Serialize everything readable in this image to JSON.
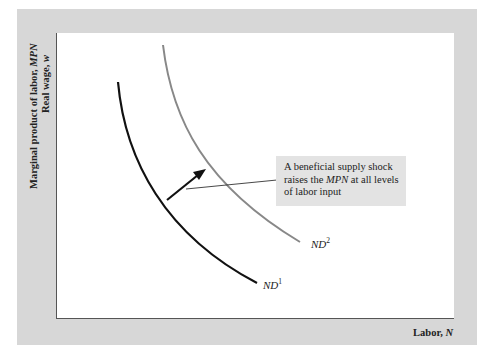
{
  "diagram": {
    "y_axis": {
      "label_line1_prefix": "Marginal product of labor, ",
      "label_line1_var": "MPN",
      "label_line2_prefix": "Real wage, ",
      "label_line2_var": "w"
    },
    "x_axis": {
      "label_prefix": "Labor, ",
      "label_var": "N"
    },
    "curves": [
      {
        "name": "ND",
        "superscript": "1",
        "color": "#111111",
        "description": "original labor demand curve"
      },
      {
        "name": "ND",
        "superscript": "2",
        "color": "#888888",
        "description": "labor demand after beneficial supply shock"
      }
    ],
    "callout": {
      "text_before": "A beneficial supply shock raises the ",
      "text_var": "MPN",
      "text_after": " at all levels of labor input"
    },
    "colors": {
      "frame": "#d7d7d7",
      "plot_bg": "#ffffff",
      "callout_bg": "#e3e3e3",
      "nd1": "#111111",
      "nd2": "#888888",
      "arrow": "#111111"
    }
  }
}
